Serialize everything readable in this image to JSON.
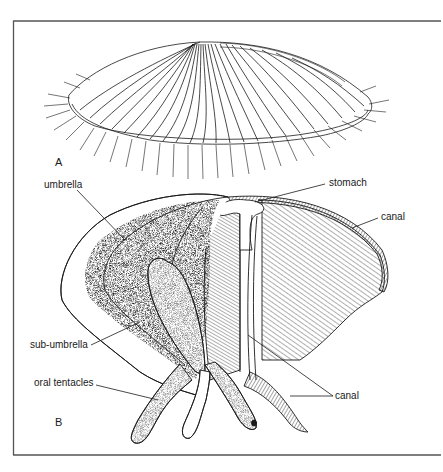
{
  "figure": {
    "panels": [
      {
        "id": "A",
        "label": "A",
        "description": "jellyfish external view, dome with radial canals and marginal tentacles"
      },
      {
        "id": "B",
        "label": "B",
        "description": "jellyfish cut-away section"
      }
    ],
    "labels": {
      "umbrella": "umbrella",
      "stomach": "stomach",
      "canal_upper": "canal",
      "sub_umbrella": "sub-umbrella",
      "oral_tentacles": "oral tentacles",
      "canal_lower": "canal"
    },
    "colors": {
      "ink": "#1a1a1a",
      "frame": "#555555",
      "background": "#ffffff"
    }
  }
}
